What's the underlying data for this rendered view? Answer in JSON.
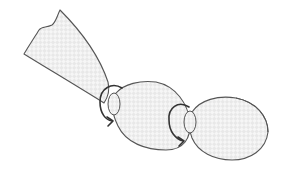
{
  "diagram": {
    "colors": {
      "outline": "#555555",
      "arrow": "#333333",
      "fill": "#e6e6e6",
      "fill_check": "#f4f4f4",
      "background": "#ffffff"
    },
    "elements": [
      {
        "id": "open-casing-end",
        "type": "casing-tail"
      },
      {
        "id": "twist-1",
        "type": "twist-arrow",
        "direction": "clockwise"
      },
      {
        "id": "link-1",
        "type": "link-oval"
      },
      {
        "id": "twist-2",
        "type": "twist-arrow",
        "direction": "clockwise"
      },
      {
        "id": "link-2",
        "type": "link-oval"
      }
    ]
  }
}
